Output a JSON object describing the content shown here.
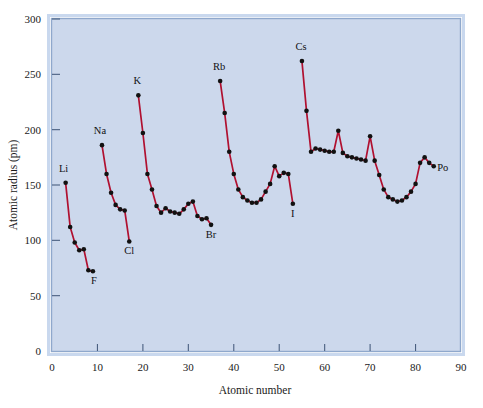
{
  "chart_data": {
    "type": "line",
    "title": "",
    "xlabel": "Atomic number",
    "ylabel": "Atomic radius (pm)",
    "xlim": [
      0,
      90
    ],
    "ylim": [
      0,
      300
    ],
    "xticks": [
      0,
      10,
      20,
      30,
      40,
      50,
      60,
      70,
      80,
      90
    ],
    "yticks": [
      0,
      50,
      100,
      150,
      200,
      250,
      300
    ],
    "xtick_labels": [
      "0",
      "10",
      "20",
      "30",
      "40",
      "50",
      "60",
      "70",
      "80",
      "90"
    ],
    "ytick_labels": [
      "0",
      "50",
      "100",
      "150",
      "200",
      "250",
      "300"
    ],
    "grid": false,
    "legend": "none",
    "marker": "filled-circle",
    "line_color": "#b01030",
    "marker_color": "#111111",
    "plot_background": "#ccd8ec",
    "frame_color": "#8fa8cc",
    "page_background": "#ffffff",
    "segments": [
      {
        "name": "period-2",
        "x": [
          3,
          4,
          5,
          6,
          7,
          8,
          9
        ],
        "y": [
          152,
          112,
          98,
          91,
          92,
          73,
          72
        ]
      },
      {
        "name": "period-3",
        "x": [
          11,
          12,
          13,
          14,
          15,
          16,
          17
        ],
        "y": [
          186,
          160,
          143,
          132,
          128,
          127,
          99
        ]
      },
      {
        "name": "period-4",
        "x": [
          19,
          20,
          21,
          22,
          23,
          24,
          25,
          26,
          27,
          28,
          29,
          30,
          31,
          32,
          33,
          34,
          35
        ],
        "y": [
          231,
          197,
          160,
          146,
          131,
          125,
          129,
          126,
          125,
          124,
          128,
          133,
          135,
          122,
          119,
          120,
          114
        ]
      },
      {
        "name": "period-5",
        "x": [
          37,
          38,
          39,
          40,
          41,
          42,
          43,
          44,
          45,
          46,
          47,
          48,
          49,
          50,
          51,
          52,
          53
        ],
        "y": [
          244,
          215,
          180,
          160,
          146,
          139,
          136,
          134,
          134,
          137,
          144,
          151,
          167,
          158,
          161,
          160,
          133
        ]
      },
      {
        "name": "period-6",
        "x": [
          55,
          56,
          57,
          58,
          59,
          60,
          61,
          62,
          63,
          64,
          65,
          66,
          67,
          68,
          69,
          70,
          71,
          72,
          73,
          74,
          75,
          76,
          77,
          78,
          79,
          80,
          81,
          82,
          83,
          84
        ],
        "y": [
          262,
          217,
          180,
          183,
          182,
          181,
          180,
          180,
          199,
          179,
          176,
          175,
          174,
          173,
          172,
          194,
          172,
          159,
          146,
          139,
          137,
          135,
          136,
          139,
          144,
          151,
          170,
          175,
          170,
          167
        ]
      }
    ],
    "point_labels": [
      {
        "element": "Li",
        "x": 3,
        "y": 152,
        "dx": -2,
        "dy": -11
      },
      {
        "element": "F",
        "x": 9,
        "y": 72,
        "dx": 1,
        "dy": 13
      },
      {
        "element": "Na",
        "x": 11,
        "y": 186,
        "dx": -2,
        "dy": -11
      },
      {
        "element": "Cl",
        "x": 17,
        "y": 99,
        "dx": 0,
        "dy": 13
      },
      {
        "element": "K",
        "x": 19,
        "y": 231,
        "dx": -1,
        "dy": -11
      },
      {
        "element": "Br",
        "x": 35,
        "y": 114,
        "dx": 0,
        "dy": 13
      },
      {
        "element": "Rb",
        "x": 37,
        "y": 244,
        "dx": -1,
        "dy": -11
      },
      {
        "element": "I",
        "x": 53,
        "y": 133,
        "dx": 0,
        "dy": 13
      },
      {
        "element": "Cs",
        "x": 55,
        "y": 262,
        "dx": -1,
        "dy": -11
      },
      {
        "element": "Po",
        "x": 84,
        "y": 167,
        "dx": 9,
        "dy": 5
      }
    ]
  }
}
